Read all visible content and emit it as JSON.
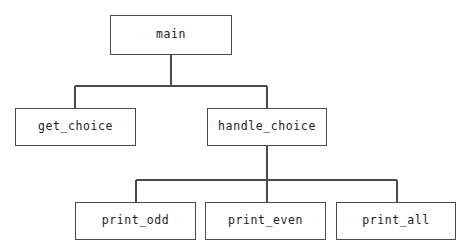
{
  "diagram": {
    "type": "call-graph-tree",
    "title": "",
    "canvas": {
      "width": 471,
      "height": 246,
      "background": "#ffffff"
    },
    "style": {
      "box_fill": "#ffffff",
      "box_border": "#4a4a4a",
      "connector_color": "#4a4a4a",
      "text_color": "#1c1c1c"
    },
    "nodes": [
      {
        "id": "main",
        "label": "main",
        "level": 0,
        "x": 110,
        "y": 15,
        "width": 122,
        "height": 40,
        "center_x": 171
      },
      {
        "id": "get_choice",
        "label": "get_choice",
        "level": 1,
        "x": 15,
        "y": 108,
        "width": 121,
        "height": 38,
        "center_x": 75
      },
      {
        "id": "handle_choice",
        "label": "handle_choice",
        "level": 1,
        "x": 207,
        "y": 108,
        "width": 120,
        "height": 38,
        "center_x": 267
      },
      {
        "id": "print_odd",
        "label": "print_odd",
        "level": 2,
        "x": 75,
        "y": 202,
        "width": 121,
        "height": 38,
        "center_x": 136
      },
      {
        "id": "print_even",
        "label": "print_even",
        "level": 2,
        "x": 205,
        "y": 202,
        "width": 121,
        "height": 38,
        "center_x": 267
      },
      {
        "id": "print_all",
        "label": "print_all",
        "level": 2,
        "x": 336,
        "y": 202,
        "width": 120,
        "height": 38,
        "center_x": 397
      }
    ],
    "edges": [
      {
        "from": "main",
        "to": "get_choice"
      },
      {
        "from": "main",
        "to": "handle_choice"
      },
      {
        "from": "handle_choice",
        "to": "print_odd"
      },
      {
        "from": "handle_choice",
        "to": "print_even"
      },
      {
        "from": "handle_choice",
        "to": "print_all"
      }
    ],
    "connector_geometry": {
      "group_main": {
        "parent_drop_x": 171,
        "parent_drop_from_y": 55,
        "bus_y": 86,
        "bus_x1": 75,
        "bus_x2": 267,
        "child_drops_x": [
          75,
          267
        ],
        "child_drop_to_y": 108
      },
      "group_handle_choice": {
        "parent_drop_x": 267,
        "parent_drop_from_y": 146,
        "bus_y": 180,
        "bus_x1": 136,
        "bus_x2": 397,
        "child_drops_x": [
          136,
          267,
          397
        ],
        "child_drop_to_y": 202
      }
    }
  }
}
